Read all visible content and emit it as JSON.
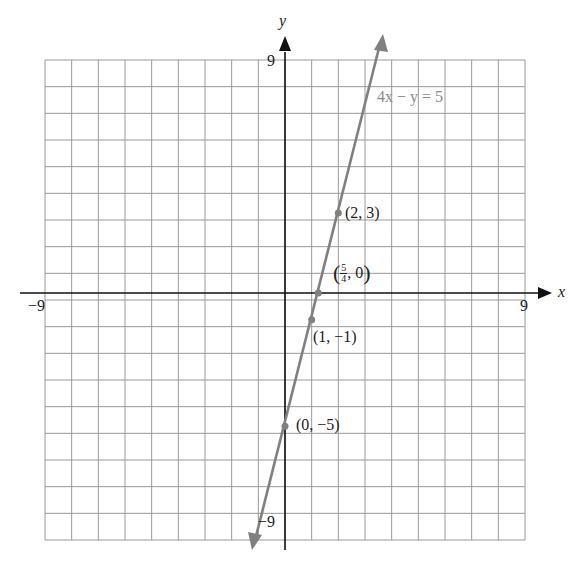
{
  "chart_data": {
    "type": "line",
    "title": "",
    "xlabel": "x",
    "ylabel": "y",
    "xlim": [
      -9,
      9
    ],
    "ylim": [
      -9,
      9
    ],
    "grid": true,
    "tick_labels": {
      "x_min": "−9",
      "x_max": "9",
      "y_min": "−9",
      "y_max": "9"
    },
    "series": [
      {
        "name": "4x − y = 5",
        "equation": "y = 4x - 5",
        "color": "#8a8a8a",
        "x": [
          -1.14,
          3.66
        ],
        "y": [
          -9.56,
          9.64
        ]
      }
    ],
    "points": [
      {
        "x": 2,
        "y": 3,
        "label": "(2, 3)"
      },
      {
        "x": 1.25,
        "y": 0,
        "label_num": "5",
        "label_den": "4",
        "label_rest": ", 0"
      },
      {
        "x": 1,
        "y": -1,
        "label": "(1, −1)"
      },
      {
        "x": 0,
        "y": -5,
        "label": "(0, −5)"
      }
    ]
  },
  "labels": {
    "axis_x": "x",
    "axis_y": "y",
    "x_min": "−9",
    "x_max": "9",
    "y_max": "9",
    "y_min": "−9",
    "equation": "4x − y = 5",
    "p1": "(2, 3)",
    "p2_open": "(",
    "p2_num": "5",
    "p2_den": "4",
    "p2_rest": ", 0",
    "p2_close": ")",
    "p3": "(1, −1)",
    "p4": "(0, −5)"
  }
}
